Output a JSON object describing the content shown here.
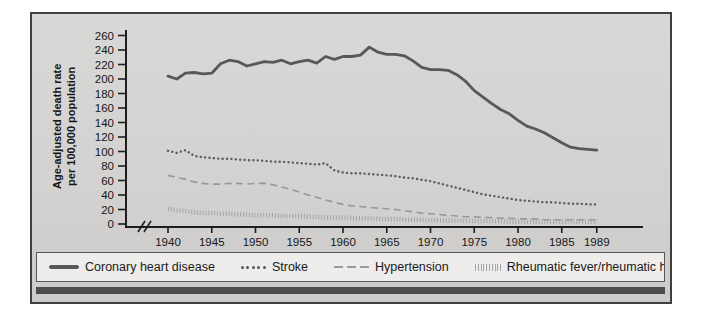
{
  "figure": {
    "y_axis_title_line1": "Age-adjusted death rate",
    "y_axis_title_line2": "per 100,000 population"
  },
  "colors": {
    "frame_border": "#3f3f3f",
    "plot_background": "#d4d3d1",
    "legend_background": "#eeedeb",
    "accent_bar": "#4d4d4d",
    "axis": "#1d1d1d"
  },
  "chart_data": {
    "type": "line",
    "ylabel": "Age-adjusted death rate per 100,000 population",
    "xlabel": "",
    "ylim": [
      0,
      260
    ],
    "y_ticks": [
      0,
      20,
      40,
      60,
      80,
      100,
      120,
      140,
      160,
      180,
      200,
      220,
      240,
      260
    ],
    "x_tick_labels": [
      1940,
      1945,
      1950,
      1955,
      1960,
      1965,
      1970,
      1975,
      1980,
      1985,
      1989
    ],
    "axis_break_before_first_year": true,
    "grid": false,
    "legend_position": "bottom",
    "x": [
      1940,
      1941,
      1942,
      1943,
      1944,
      1945,
      1946,
      1947,
      1948,
      1949,
      1950,
      1951,
      1952,
      1953,
      1954,
      1955,
      1956,
      1957,
      1958,
      1959,
      1960,
      1961,
      1962,
      1963,
      1964,
      1965,
      1966,
      1967,
      1968,
      1969,
      1970,
      1971,
      1972,
      1973,
      1974,
      1975,
      1976,
      1977,
      1978,
      1979,
      1980,
      1981,
      1982,
      1983,
      1984,
      1985,
      1986,
      1987,
      1988,
      1989
    ],
    "series": [
      {
        "name": "Coronary heart disease",
        "style": "solid",
        "color": "#585858",
        "values": [
          204,
          200,
          208,
          209,
          207,
          208,
          221,
          226,
          224,
          218,
          221,
          224,
          223,
          226,
          221,
          224,
          226,
          222,
          231,
          227,
          231,
          231,
          233,
          244,
          237,
          234,
          234,
          232,
          225,
          216,
          213,
          213,
          212,
          206,
          197,
          184,
          175,
          166,
          158,
          152,
          143,
          135,
          131,
          126,
          119,
          112,
          106,
          104,
          103,
          102
        ]
      },
      {
        "name": "Stroke",
        "style": "dotted",
        "color": "#5e5e5e",
        "values": [
          101,
          98,
          102,
          94,
          92,
          91,
          90,
          90,
          89,
          88,
          88,
          87,
          86,
          86,
          85,
          84,
          83,
          82,
          84,
          74,
          71,
          70,
          70,
          69,
          68,
          67,
          66,
          64,
          63,
          61,
          59,
          56,
          53,
          50,
          47,
          44,
          41,
          39,
          37,
          35,
          33,
          32,
          31,
          30,
          30,
          29,
          28,
          28,
          27,
          27
        ]
      },
      {
        "name": "Hypertension",
        "style": "dashed",
        "color": "#989898",
        "values": [
          67,
          64,
          62,
          58,
          56,
          55,
          55,
          56,
          56,
          55,
          56,
          56,
          54,
          51,
          48,
          44,
          40,
          37,
          33,
          30,
          27,
          25,
          24,
          23,
          22,
          21,
          20,
          18,
          17,
          15,
          14,
          13,
          12,
          11,
          10,
          10,
          9,
          9,
          8,
          8,
          7,
          7,
          7,
          6,
          6,
          6,
          6,
          6,
          6,
          6
        ]
      },
      {
        "name": "Rheumatic fever/rheumatic heart disease",
        "style": "tick-dotted",
        "color": "#a5a5a5",
        "values": [
          21,
          19,
          18,
          16,
          15,
          15,
          14,
          14,
          13,
          13,
          12,
          12,
          12,
          11,
          11,
          11,
          10,
          10,
          9,
          9,
          9,
          8,
          8,
          8,
          7,
          7,
          7,
          6,
          6,
          6,
          5,
          5,
          5,
          5,
          4,
          4,
          4,
          4,
          4,
          3,
          3,
          3,
          3,
          3,
          3,
          3,
          3,
          3,
          3,
          3
        ]
      }
    ]
  }
}
